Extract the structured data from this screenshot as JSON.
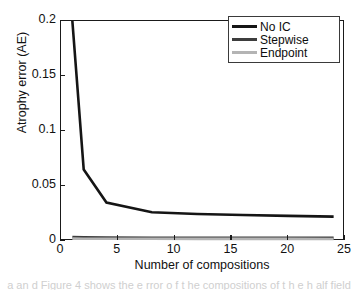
{
  "figure": {
    "background": "#ffffff",
    "frame_color": "#1a1a1a"
  },
  "caption_bleed": {
    "text": "a an d Figure 4 shows the e rror o f t he compositions of t h e h alf field"
  },
  "legend": {
    "position": "top-right",
    "border_color": "#3a3a3a",
    "entries": [
      {
        "label": "No IC",
        "color": "#151515"
      },
      {
        "label": "Stepwise",
        "color": "#3d3d3d"
      },
      {
        "label": "Endpoint",
        "color": "#b4b4b4"
      }
    ]
  },
  "axes": {
    "x": {
      "label": "Number of compositions",
      "ticks": [
        "0",
        "5",
        "10",
        "15",
        "20",
        "25"
      ],
      "tick_values": [
        0,
        5,
        10,
        15,
        20,
        25
      ],
      "min": 0,
      "max": 25
    },
    "y": {
      "label": "Atrophy error (AE)",
      "ticks": [
        "0",
        "0.05",
        "0.1",
        "0.15",
        "0.2"
      ],
      "tick_values": [
        0,
        0.05,
        0.1,
        0.15,
        0.2
      ],
      "min": 0,
      "max": 0.2
    }
  },
  "chart_data": {
    "type": "line",
    "title": "",
    "xlabel": "Number of compositions",
    "ylabel": "Atrophy error (AE)",
    "xlim": [
      0,
      25
    ],
    "ylim": [
      0,
      0.2
    ],
    "grid": false,
    "legend_position": "upper right",
    "x": [
      1,
      2,
      4,
      8,
      12,
      16,
      20,
      24
    ],
    "series": [
      {
        "name": "No IC",
        "color": "#151515",
        "linewidth": 2.6,
        "values": [
          0.2,
          0.065,
          0.035,
          0.0262,
          0.0246,
          0.0236,
          0.0228,
          0.0222
        ]
      },
      {
        "name": "Stepwise",
        "color": "#3d3d3d",
        "linewidth": 2.6,
        "values": [
          0.0035,
          0.0033,
          0.0031,
          0.003,
          0.0029,
          0.0029,
          0.0028,
          0.0028
        ]
      },
      {
        "name": "Endpoint",
        "color": "#b4b4b4",
        "linewidth": 2.6,
        "values": [
          0.0022,
          0.0021,
          0.002,
          0.002,
          0.0019,
          0.0019,
          0.0019,
          0.0018
        ]
      }
    ]
  }
}
